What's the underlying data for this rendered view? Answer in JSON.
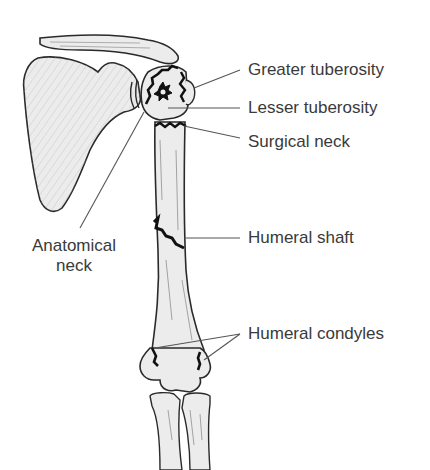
{
  "diagram": {
    "labels": {
      "greater_tuberosity": "Greater tuberosity",
      "lesser_tuberosity": "Lesser tuberosity",
      "surgical_neck": "Surgical neck",
      "anatomical_neck_line1": "Anatomical",
      "anatomical_neck_line2": "neck",
      "humeral_shaft": "Humeral shaft",
      "humeral_condyles": "Humeral condyles"
    },
    "colors": {
      "outline": "#2a2a2a",
      "fracture": "#111111",
      "bone_fill": "#ececec",
      "shading": "#9a9a9a",
      "leader": "#555555",
      "text": "#3a3a3a"
    }
  }
}
